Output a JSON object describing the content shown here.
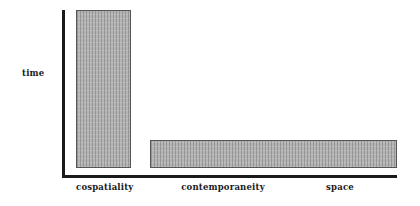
{
  "diagram": {
    "y_axis_label": "time",
    "x_axis_labels": [
      "cospatiality",
      "contemporaneity",
      "space"
    ],
    "bars": [
      {
        "label": "cospatiality",
        "description": "tall narrow bar spanning nearly full time axis"
      },
      {
        "label": "contemporaneity / space",
        "description": "short wide bar spanning contemporaneity and space"
      }
    ],
    "colors": {
      "axis": "#1a1a1a",
      "bar_fill": "#b4b4b4",
      "bar_border": "#555555",
      "background": "#ffffff"
    }
  }
}
